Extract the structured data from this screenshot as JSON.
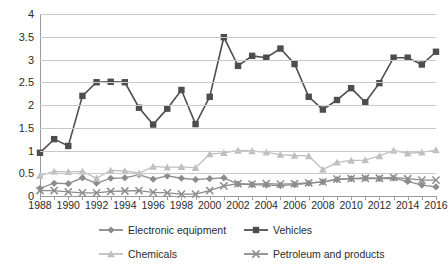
{
  "chart_data": {
    "type": "line",
    "title": "",
    "xlabel": "",
    "ylabel": "",
    "ylim": [
      0,
      4
    ],
    "ytick_step": 0.5,
    "grid": true,
    "legend_position": "bottom",
    "x": [
      1988,
      1989,
      1990,
      1991,
      1992,
      1993,
      1994,
      1995,
      1996,
      1997,
      1998,
      1999,
      2000,
      2001,
      2002,
      2003,
      2004,
      2005,
      2006,
      2007,
      2008,
      2009,
      2010,
      2011,
      2012,
      2013,
      2014,
      2015,
      2016
    ],
    "x_tick_labels": [
      "1988",
      "1990",
      "1992",
      "1994",
      "1996",
      "1998",
      "2000",
      "2002",
      "2004",
      "2006",
      "2008",
      "2010",
      "2012",
      "2014",
      "2016"
    ],
    "y_tick_labels": [
      "0",
      "0.5",
      "1",
      "1.5",
      "2",
      "2.5",
      "3",
      "3.5",
      "4"
    ],
    "series": [
      {
        "name": "Electronic equipment",
        "marker": "diamond",
        "color": "#8c8c8c",
        "values": [
          0.17,
          0.28,
          0.27,
          0.4,
          0.28,
          0.39,
          0.4,
          0.47,
          0.37,
          0.44,
          0.39,
          0.36,
          0.38,
          0.4,
          0.26,
          0.25,
          0.24,
          0.23,
          0.25,
          0.28,
          0.31,
          0.36,
          0.38,
          0.39,
          0.38,
          0.39,
          0.32,
          0.24,
          0.2
        ]
      },
      {
        "name": "Vehicles",
        "marker": "square",
        "color": "#4d4d4d",
        "values": [
          0.95,
          1.25,
          1.1,
          2.2,
          2.5,
          2.51,
          2.5,
          1.94,
          1.57,
          1.92,
          2.33,
          1.58,
          2.18,
          3.49,
          2.86,
          3.08,
          3.04,
          3.24,
          2.9,
          2.18,
          1.9,
          2.11,
          2.37,
          2.06,
          2.48,
          3.04,
          3.04,
          2.89,
          3.17
        ]
      },
      {
        "name": "Chemicals",
        "marker": "triangle",
        "color": "#bfbfbf",
        "values": [
          0.45,
          0.54,
          0.53,
          0.54,
          0.39,
          0.56,
          0.55,
          0.5,
          0.65,
          0.63,
          0.64,
          0.62,
          0.92,
          0.95,
          1.0,
          0.99,
          0.96,
          0.91,
          0.89,
          0.88,
          0.58,
          0.74,
          0.78,
          0.79,
          0.88,
          1.0,
          0.94,
          0.96,
          1.01
        ]
      },
      {
        "name": "Petroleum and products",
        "marker": "cross",
        "color": "#8c8c8c",
        "values": [
          0.12,
          0.12,
          0.09,
          0.07,
          0.07,
          0.1,
          0.11,
          0.12,
          0.08,
          0.07,
          0.04,
          0.04,
          0.12,
          0.22,
          0.27,
          0.26,
          0.27,
          0.26,
          0.27,
          0.29,
          0.31,
          0.37,
          0.38,
          0.39,
          0.39,
          0.41,
          0.38,
          0.35,
          0.35
        ]
      }
    ]
  },
  "legend": {
    "items": [
      {
        "label": "Electronic equipment"
      },
      {
        "label": "Vehicles"
      },
      {
        "label": "Chemicals"
      },
      {
        "label": "Petroleum and products"
      }
    ]
  },
  "colors": {
    "grid": "#c9c9c9",
    "axis": "#9a9a9a",
    "text": "#2b2b2b",
    "background": "#ffffff"
  }
}
